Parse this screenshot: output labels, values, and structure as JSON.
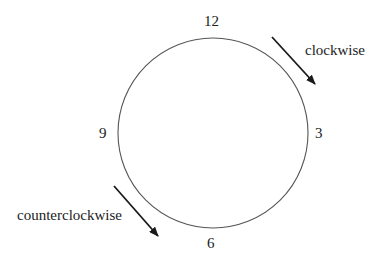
{
  "diagram": {
    "type": "clock-direction",
    "circle": {
      "cx": 213,
      "cy": 133,
      "r": 95,
      "stroke": "#555555"
    },
    "numbers": {
      "twelve": "12",
      "three": "3",
      "six": "6",
      "nine": "9"
    },
    "labels": {
      "clockwise": "clockwise",
      "counterclockwise": "counterclockwise"
    },
    "arrows": [
      {
        "name": "clockwise-arrow",
        "x1": 272,
        "y1": 37,
        "x2": 315,
        "y2": 84
      },
      {
        "name": "counterclockwise-arrow",
        "x1": 114,
        "y1": 186,
        "x2": 158,
        "y2": 236
      }
    ],
    "colors": {
      "line": "#555555",
      "arrow": "#1a1a1a",
      "text": "#222222"
    }
  }
}
